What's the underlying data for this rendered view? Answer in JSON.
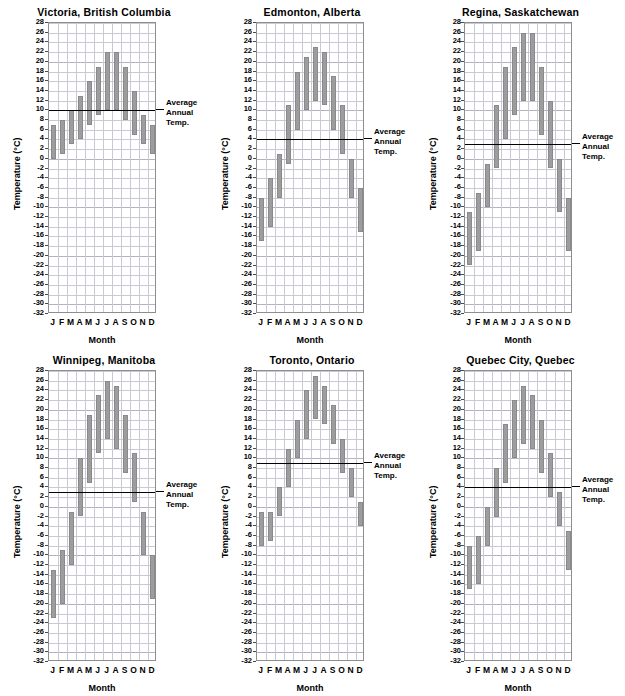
{
  "figure": {
    "axis_labels": {
      "y": "Temperature (°C)",
      "x": "Month"
    },
    "avg_label_lines": [
      "Average",
      "Annual",
      "Temp."
    ],
    "y_ticks": [
      28,
      26,
      24,
      22,
      20,
      18,
      16,
      14,
      12,
      10,
      8,
      6,
      4,
      2,
      0,
      -2,
      -4,
      -6,
      -8,
      -10,
      -12,
      -14,
      -16,
      -18,
      -20,
      -22,
      -24,
      -26,
      -28,
      -30,
      -32
    ],
    "y_tick_labels": [
      "28",
      "26",
      "24",
      "22",
      "20",
      "18",
      "16",
      "14",
      "12",
      "10",
      "8",
      "6",
      "4",
      "2",
      "0",
      "-2",
      "-4",
      "-6",
      "-8",
      "-10",
      "-12",
      "-14",
      "-16",
      "-18",
      "-20",
      "-22",
      "-24",
      "-26",
      "-28",
      "-30",
      "-32"
    ],
    "x_tick_labels": [
      "J",
      "F",
      "M",
      "A",
      "M",
      "J",
      "J",
      "A",
      "S",
      "O",
      "N",
      "D"
    ],
    "bar_color": "#9d9d9d",
    "grid_color": "#c9c9d6",
    "axis_color": "#8e8e8e"
  },
  "chart_data": [
    {
      "type": "bar",
      "title": "Victoria, British Columbia",
      "xlabel": "Month",
      "ylabel": "Temperature (°C)",
      "ylim": [
        -32,
        28
      ],
      "grid": true,
      "categories": [
        "J",
        "F",
        "M",
        "A",
        "M",
        "J",
        "J",
        "A",
        "S",
        "O",
        "N",
        "D"
      ],
      "series": [
        {
          "name": "Monthly minimum temperature",
          "values": [
            0,
            1,
            3,
            4,
            7,
            9,
            10,
            10,
            8,
            5,
            3,
            1
          ]
        },
        {
          "name": "Monthly maximum temperature",
          "values": [
            7,
            8,
            10,
            13,
            16,
            19,
            22,
            22,
            19,
            14,
            9,
            7
          ]
        }
      ],
      "annotations": [
        {
          "label": "Average Annual Temp.",
          "value": 10,
          "type": "hline"
        }
      ]
    },
    {
      "type": "bar",
      "title": "Edmonton, Alberta",
      "xlabel": "Month",
      "ylabel": "Temperature (°C)",
      "ylim": [
        -32,
        28
      ],
      "grid": true,
      "categories": [
        "J",
        "F",
        "M",
        "A",
        "M",
        "J",
        "J",
        "A",
        "S",
        "O",
        "N",
        "D"
      ],
      "series": [
        {
          "name": "Monthly minimum temperature",
          "values": [
            -17,
            -14,
            -8,
            -1,
            6,
            10,
            12,
            11,
            6,
            1,
            -8,
            -15
          ]
        },
        {
          "name": "Monthly maximum temperature",
          "values": [
            -8,
            -4,
            1,
            11,
            18,
            21,
            23,
            22,
            17,
            11,
            0,
            -6
          ]
        }
      ],
      "annotations": [
        {
          "label": "Average Annual Temp.",
          "value": 4,
          "type": "hline"
        }
      ]
    },
    {
      "type": "bar",
      "title": "Regina, Saskatchewan",
      "xlabel": "Month",
      "ylabel": "Temperature (°C)",
      "ylim": [
        -32,
        28
      ],
      "grid": true,
      "categories": [
        "J",
        "F",
        "M",
        "A",
        "M",
        "J",
        "J",
        "A",
        "S",
        "O",
        "N",
        "D"
      ],
      "series": [
        {
          "name": "Monthly minimum temperature",
          "values": [
            -22,
            -19,
            -10,
            -2,
            4,
            9,
            12,
            12,
            5,
            -2,
            -11,
            -19
          ]
        },
        {
          "name": "Monthly maximum temperature",
          "values": [
            -11,
            -7,
            -1,
            11,
            19,
            23,
            26,
            26,
            19,
            12,
            0,
            -8
          ]
        }
      ],
      "annotations": [
        {
          "label": "Average Annual Temp.",
          "value": 3,
          "type": "hline"
        }
      ]
    },
    {
      "type": "bar",
      "title": "Winnipeg, Manitoba",
      "xlabel": "Month",
      "ylabel": "Temperature (°C)",
      "ylim": [
        -32,
        28
      ],
      "grid": true,
      "categories": [
        "J",
        "F",
        "M",
        "A",
        "M",
        "J",
        "J",
        "A",
        "S",
        "O",
        "N",
        "D"
      ],
      "series": [
        {
          "name": "Monthly minimum temperature",
          "values": [
            -23,
            -20,
            -12,
            -2,
            5,
            11,
            14,
            12,
            7,
            1,
            -10,
            -19
          ]
        },
        {
          "name": "Monthly maximum temperature",
          "values": [
            -13,
            -9,
            -1,
            10,
            19,
            23,
            26,
            25,
            19,
            11,
            -1,
            -10
          ]
        }
      ],
      "annotations": [
        {
          "label": "Average Annual Temp.",
          "value": 3,
          "type": "hline"
        }
      ]
    },
    {
      "type": "bar",
      "title": "Toronto, Ontario",
      "xlabel": "Month",
      "ylabel": "Temperature (°C)",
      "ylim": [
        -32,
        28
      ],
      "grid": true,
      "categories": [
        "J",
        "F",
        "M",
        "A",
        "M",
        "J",
        "J",
        "A",
        "S",
        "O",
        "N",
        "D"
      ],
      "series": [
        {
          "name": "Monthly minimum temperature",
          "values": [
            -8,
            -7,
            -2,
            4,
            10,
            14,
            18,
            17,
            13,
            7,
            2,
            -4
          ]
        },
        {
          "name": "Monthly maximum temperature",
          "values": [
            -1,
            -1,
            4,
            12,
            18,
            24,
            27,
            25,
            21,
            14,
            8,
            1
          ]
        }
      ],
      "annotations": [
        {
          "label": "Average Annual Temp.",
          "value": 9,
          "type": "hline"
        }
      ]
    },
    {
      "type": "bar",
      "title": "Quebec City, Quebec",
      "xlabel": "Month",
      "ylabel": "Temperature (°C)",
      "ylim": [
        -32,
        28
      ],
      "grid": true,
      "categories": [
        "J",
        "F",
        "M",
        "A",
        "M",
        "J",
        "J",
        "A",
        "S",
        "O",
        "N",
        "D"
      ],
      "series": [
        {
          "name": "Monthly minimum temperature",
          "values": [
            -17,
            -16,
            -8,
            -2,
            5,
            10,
            13,
            12,
            7,
            2,
            -4,
            -13
          ]
        },
        {
          "name": "Monthly maximum temperature",
          "values": [
            -8,
            -6,
            0,
            8,
            17,
            22,
            25,
            23,
            18,
            11,
            3,
            -5
          ]
        }
      ],
      "annotations": [
        {
          "label": "Average Annual Temp.",
          "value": 4,
          "type": "hline"
        }
      ]
    }
  ]
}
